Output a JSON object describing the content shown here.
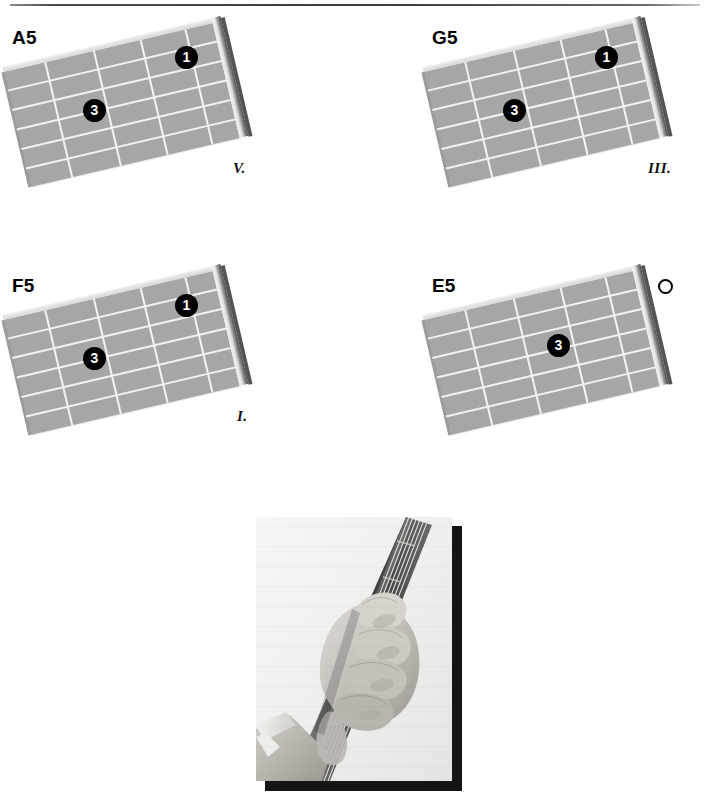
{
  "page": {
    "background_color": "#ffffff",
    "top_rule_color": "#3c3c3c"
  },
  "diagrams": [
    {
      "id": "a5",
      "chord_name": "A5",
      "fret_label": "V.",
      "markers": [
        {
          "finger": "1",
          "type": "filled",
          "string": 5,
          "fret": 1
        },
        {
          "finger": "3",
          "type": "filled",
          "string": 4,
          "fret": 3
        }
      ]
    },
    {
      "id": "g5",
      "chord_name": "G5",
      "fret_label": "III.",
      "markers": [
        {
          "finger": "1",
          "type": "filled",
          "string": 5,
          "fret": 1
        },
        {
          "finger": "3",
          "type": "filled",
          "string": 4,
          "fret": 3
        }
      ]
    },
    {
      "id": "f5",
      "chord_name": "F5",
      "fret_label": "I.",
      "markers": [
        {
          "finger": "1",
          "type": "filled",
          "string": 5,
          "fret": 1
        },
        {
          "finger": "3",
          "type": "filled",
          "string": 4,
          "fret": 3
        }
      ]
    },
    {
      "id": "e5",
      "chord_name": "E5",
      "fret_label": "",
      "markers": [
        {
          "finger": "",
          "type": "open",
          "string": 5,
          "fret": 0
        },
        {
          "finger": "3",
          "type": "filled",
          "string": 4,
          "fret": 2
        }
      ]
    }
  ],
  "photo": {
    "alt_name": "hand-fretting-guitar-neck-photo",
    "description": "Black and white photograph of a left hand fretting a power chord on a guitar neck"
  },
  "colors": {
    "fretboard": "#a6a6a6",
    "string_line": "#f1f1f1",
    "marker_fill": "#000000",
    "marker_text": "#ffffff",
    "photo_shadow": "#151515"
  }
}
